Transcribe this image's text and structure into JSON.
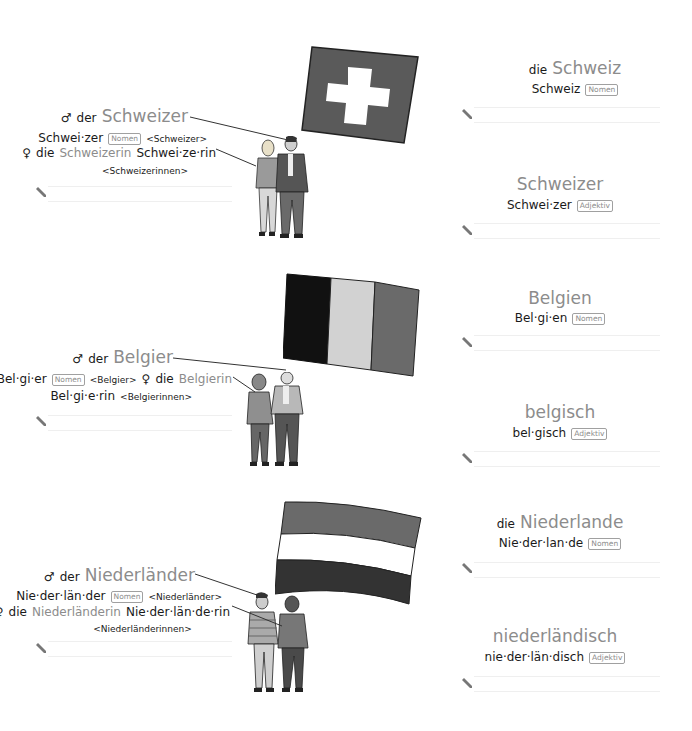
{
  "entries": [
    {
      "country_flag": "switzerland-flag",
      "demonym": {
        "male_symbol": "♂",
        "male_article": "der",
        "male_word": "Schweizer",
        "male_syllables": "Schwei·zer",
        "tag": "Nomen",
        "male_plural": "<Schweizer>",
        "female_symbol": "♀",
        "female_article": "die",
        "female_word": "Schweizerin",
        "female_syllables": "Schwei·ze·rin",
        "female_plural": "<Schweizerinnen>"
      },
      "country": {
        "article": "die",
        "word": "Schweiz",
        "syllables": "Schweiz",
        "tag": "Nomen"
      },
      "adjective": {
        "word": "Schweizer",
        "syllables": "Schwei·zer",
        "tag": "Adjektiv"
      }
    },
    {
      "country_flag": "belgium-flag",
      "demonym": {
        "male_symbol": "♂",
        "male_article": "der",
        "male_word": "Belgier",
        "male_syllables": "Bel·gi·er",
        "tag": "Nomen",
        "male_plural": "<Belgier>",
        "female_symbol": "♀",
        "female_article": "die",
        "female_word": "Belgierin",
        "female_syllables": "Bel·gi·e·rin",
        "female_plural": "<Belgierinnen>"
      },
      "country": {
        "article": "",
        "word": "Belgien",
        "syllables": "Bel·gi·en",
        "tag": "Nomen"
      },
      "adjective": {
        "word": "belgisch",
        "syllables": "bel·gisch",
        "tag": "Adjektiv"
      }
    },
    {
      "country_flag": "netherlands-flag",
      "demonym": {
        "male_symbol": "♂",
        "male_article": "der",
        "male_word": "Niederländer",
        "male_syllables": "Nie·der·län·der",
        "tag": "Nomen",
        "male_plural": "<Niederländer>",
        "female_symbol": "♀",
        "female_article": "die",
        "female_word": "Niederländerin",
        "female_syllables": "Nie·der·län·de·rin",
        "female_plural": "<Niederländerinnen>"
      },
      "country": {
        "article": "die",
        "word": "Niederlande",
        "syllables": "Nie·der·lan·de",
        "tag": "Nomen"
      },
      "adjective": {
        "word": "niederländisch",
        "syllables": "nie·der·län·disch",
        "tag": "Adjektiv"
      }
    }
  ],
  "colors": {
    "text": "#1a1a1a",
    "accent_grey": "#8c8c8c",
    "tag_border": "#a0a0a0",
    "writing_line": "#efefef"
  }
}
